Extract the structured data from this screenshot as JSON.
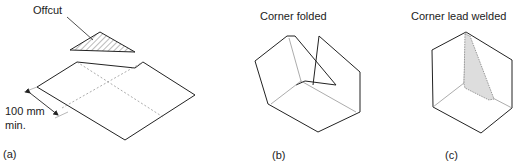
{
  "figure": {
    "panels": [
      {
        "id": "a",
        "label": "(a)",
        "annotations": {
          "offcut": "Offcut",
          "dimension_value": "100 mm",
          "dimension_qualifier": "min."
        }
      },
      {
        "id": "b",
        "label": "(b)",
        "title": "Corner folded"
      },
      {
        "id": "c",
        "label": "(c)",
        "title": "Corner lead welded"
      }
    ],
    "colors": {
      "line": "#222222",
      "fold_line": "#888888",
      "hatch": "#555555",
      "weld": "#999999"
    }
  }
}
